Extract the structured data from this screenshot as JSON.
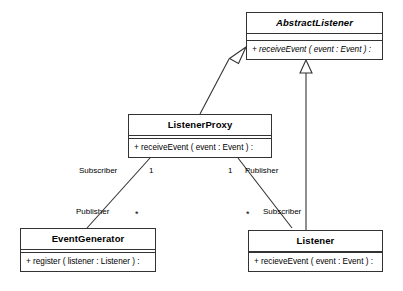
{
  "diagram": {
    "type": "uml-class-diagram",
    "background_color": "#ffffff",
    "line_color": "#333333",
    "text_color": "#000000",
    "classes": [
      {
        "id": "abstract-listener",
        "name": "AbstractListener",
        "abstract": true,
        "attributes": [],
        "operations": [
          "+ receiveEvent ( event : Event ) :"
        ]
      },
      {
        "id": "listener-proxy",
        "name": "ListenerProxy",
        "abstract": false,
        "attributes": [],
        "operations": [
          "+ receiveEvent ( event : Event ) :"
        ]
      },
      {
        "id": "event-generator",
        "name": "EventGenerator",
        "abstract": false,
        "attributes": [],
        "operations": [
          "+ register ( listener : Listener ) :"
        ]
      },
      {
        "id": "listener",
        "name": "Listener",
        "abstract": false,
        "attributes": [],
        "operations": [
          "+ recieveEvent ( event : Event ) :"
        ]
      }
    ],
    "relationships": [
      {
        "id": "proxy-generalizes-abstract",
        "kind": "generalization",
        "from": "listener-proxy",
        "to": "abstract-listener"
      },
      {
        "id": "listener-generalizes-abstract",
        "kind": "generalization",
        "from": "listener",
        "to": "abstract-listener"
      },
      {
        "id": "proxy-to-generator",
        "kind": "association",
        "from": "listener-proxy",
        "to": "event-generator",
        "from_role": "Subscriber",
        "from_multiplicity": "1",
        "to_role": "Publisher",
        "to_multiplicity": "*"
      },
      {
        "id": "proxy-to-listener",
        "kind": "association",
        "from": "listener-proxy",
        "to": "listener",
        "from_role": "Publisher",
        "from_multiplicity": "1",
        "to_role": "Subscriber",
        "to_multiplicity": "*"
      }
    ],
    "labels": {
      "subscriber_upper_left": "Subscriber",
      "mult_one_left": "1",
      "mult_one_right": "1",
      "publisher_upper_right": "Publisher",
      "publisher_lower_left": "Publisher",
      "star_lower_left": "*",
      "star_lower_right": "*",
      "subscriber_lower_right": "Subscriber"
    }
  }
}
